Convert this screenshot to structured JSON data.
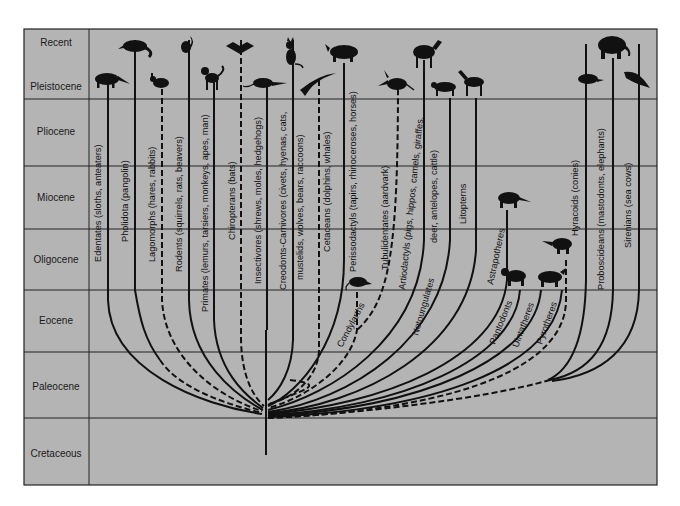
{
  "figure": {
    "type": "phylogenetic-tree",
    "background_color": "#b4b4b4",
    "line_color": "#111111",
    "time_axis": {
      "eras": [
        {
          "name": "Recent",
          "y_top": 29,
          "y_bottom": 64
        },
        {
          "name": "Pleistocene",
          "y_top": 64,
          "y_bottom": 99
        },
        {
          "name": "Pliocene",
          "y_top": 99,
          "y_bottom": 166
        },
        {
          "name": "Miocene",
          "y_top": 166,
          "y_bottom": 229
        },
        {
          "name": "Oligocene",
          "y_top": 229,
          "y_bottom": 290
        },
        {
          "name": "Eocene",
          "y_top": 290,
          "y_bottom": 352
        },
        {
          "name": "Paleocene",
          "y_top": 352,
          "y_bottom": 418
        },
        {
          "name": "Cretaceous",
          "y_top": 418,
          "y_bottom": 485
        }
      ]
    },
    "lineages": [
      {
        "id": "edentates",
        "label": "Edentates (sloths, anteaters)",
        "silhouette": "anteater-silhouette"
      },
      {
        "id": "pholidota",
        "label": "Pholidota (pangolin)",
        "silhouette": "pangolin-silhouette"
      },
      {
        "id": "lagomorphs",
        "label": "Lagomorphs (hares, rabbits)",
        "silhouette": "rabbit-silhouette"
      },
      {
        "id": "rodents",
        "label": "Rodents (squirrels, rats, beavers)",
        "silhouette": "squirrel-silhouette"
      },
      {
        "id": "primates",
        "label": "Primates (lemurs, tarsiers, monkeys, apes, man)",
        "silhouette": "monkey-silhouette"
      },
      {
        "id": "chiropterans",
        "label": "Chiropterans (bats)",
        "silhouette": "bat-silhouette"
      },
      {
        "id": "insectivores",
        "label": "Insectivores (shrews, moles, hedgehogs)",
        "silhouette": "shrew-silhouette"
      },
      {
        "id": "creodonts1",
        "label": "Creodonts-Carnivores (civets, hyenas, cats,",
        "silhouette": "cat-silhouette"
      },
      {
        "id": "creodonts2",
        "label": "mustelids, wolves, bears, raccoons)",
        "silhouette": ""
      },
      {
        "id": "cetaceans",
        "label": "Cetaceans (dolphins, whales)",
        "silhouette": "dolphin-silhouette"
      },
      {
        "id": "perissodactyls",
        "label": "Perissodactyls (tapirs, rhinoceroses, horses)",
        "silhouette": "rhinoceros-silhouette"
      },
      {
        "id": "condylarths",
        "label": "Condylarths",
        "silhouette": "condylarth-silhouette"
      },
      {
        "id": "tubulidentates",
        "label": "Tubulidentates (aardvark)",
        "silhouette": "aardvark-silhouette"
      },
      {
        "id": "artiodactyls1",
        "label": "Artiodactyls (pigs, hippos, camels, giraffes,",
        "silhouette": "camel-silhouette"
      },
      {
        "id": "artiodactyls2",
        "label": "deer, antelopes, cattle)",
        "silhouette": ""
      },
      {
        "id": "notoungulates",
        "label": "Notoungulates",
        "silhouette": "notoungulate-silhouette"
      },
      {
        "id": "litopterns",
        "label": "Litopterns",
        "silhouette": "litoptern-silhouette"
      },
      {
        "id": "astrapotheres",
        "label": "Astrapotheres",
        "silhouette": "astrapothere-silhouette"
      },
      {
        "id": "pantodonts",
        "label": "Pantodonts",
        "silhouette": "pantodont-silhouette"
      },
      {
        "id": "uintatheres",
        "label": "Uintatheres",
        "silhouette": "uintathere-silhouette"
      },
      {
        "id": "pyrotheres",
        "label": "Pyrotheres",
        "silhouette": "pyrothere-silhouette"
      },
      {
        "id": "hyracoids",
        "label": "Hyracoids (conies)",
        "silhouette": "hyrax-silhouette"
      },
      {
        "id": "proboscideans",
        "label": "Proboscideans (mastodonts, elephants)",
        "silhouette": "elephant-silhouette"
      },
      {
        "id": "sirenians",
        "label": "Sirenians (sea cows)",
        "silhouette": "sea-cow-silhouette"
      }
    ]
  }
}
